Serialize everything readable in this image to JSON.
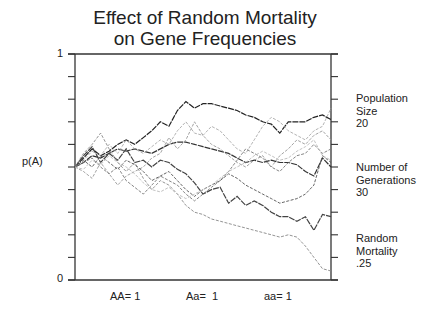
{
  "chart_data": {
    "type": "line",
    "title": "Effect of Random Mortality on Gene Frequencies",
    "title_lines": [
      "Effect of Random Mortality",
      "on Gene Frequencies"
    ],
    "xlabel": "",
    "ylabel": "p(A)",
    "ylim": [
      0,
      1
    ],
    "xlim": [
      0,
      30
    ],
    "y_tick_labels": [
      "0",
      "1"
    ],
    "y_ticks": [
      0,
      0.1,
      0.2,
      0.3,
      0.4,
      0.5,
      0.6,
      0.7,
      0.8,
      0.9,
      1.0
    ],
    "grid": false,
    "legend": "none",
    "parameters": {
      "population_size": 20,
      "number_of_generations": 30,
      "random_mortality": 0.25,
      "fitness": {
        "AA": 1,
        "Aa": 1,
        "aa": 1
      }
    },
    "x": [
      0,
      1,
      2,
      3,
      4,
      5,
      6,
      7,
      8,
      9,
      10,
      11,
      12,
      13,
      14,
      15,
      16,
      17,
      18,
      19,
      20,
      21,
      22,
      23,
      24,
      25,
      26,
      27,
      28,
      29,
      30
    ],
    "series": [
      {
        "name": "run 1",
        "shade": "#222222",
        "values": [
          0.5,
          0.54,
          0.58,
          0.55,
          0.57,
          0.6,
          0.62,
          0.6,
          0.63,
          0.66,
          0.7,
          0.68,
          0.75,
          0.79,
          0.76,
          0.78,
          0.78,
          0.77,
          0.76,
          0.75,
          0.73,
          0.72,
          0.7,
          0.69,
          0.65,
          0.7,
          0.7,
          0.7,
          0.72,
          0.73,
          0.71
        ]
      },
      {
        "name": "run 2",
        "shade": "#333333",
        "values": [
          0.5,
          0.52,
          0.55,
          0.54,
          0.56,
          0.58,
          0.57,
          0.58,
          0.57,
          0.56,
          0.58,
          0.6,
          0.61,
          0.61,
          0.6,
          0.59,
          0.58,
          0.57,
          0.56,
          0.54,
          0.52,
          0.53,
          0.52,
          0.53,
          0.52,
          0.52,
          0.51,
          0.48,
          0.46,
          0.54,
          0.5
        ]
      },
      {
        "name": "run 3",
        "shade": "#444444",
        "values": [
          0.5,
          0.55,
          0.59,
          0.52,
          0.56,
          0.53,
          0.58,
          0.52,
          0.53,
          0.5,
          0.53,
          0.52,
          0.49,
          0.47,
          0.43,
          0.38,
          0.4,
          0.41,
          0.34,
          0.37,
          0.33,
          0.35,
          0.33,
          0.3,
          0.28,
          0.28,
          0.26,
          0.28,
          0.22,
          0.29,
          0.28
        ]
      },
      {
        "name": "run 4",
        "shade": "#888888",
        "values": [
          0.5,
          0.56,
          0.6,
          0.65,
          0.58,
          0.52,
          0.48,
          0.52,
          0.45,
          0.4,
          0.44,
          0.42,
          0.38,
          0.33,
          0.3,
          0.29,
          0.27,
          0.26,
          0.25,
          0.24,
          0.23,
          0.22,
          0.21,
          0.2,
          0.19,
          0.2,
          0.19,
          0.15,
          0.1,
          0.05,
          0.04
        ]
      },
      {
        "name": "run 5",
        "shade": "#999999",
        "values": [
          0.5,
          0.48,
          0.45,
          0.52,
          0.47,
          0.42,
          0.46,
          0.48,
          0.5,
          0.54,
          0.56,
          0.63,
          0.58,
          0.62,
          0.7,
          0.64,
          0.6,
          0.58,
          0.55,
          0.52,
          0.5,
          0.53,
          0.55,
          0.5,
          0.55,
          0.58,
          0.62,
          0.6,
          0.64,
          0.66,
          0.62
        ]
      },
      {
        "name": "run 6",
        "shade": "#aaaaaa",
        "values": [
          0.5,
          0.53,
          0.57,
          0.55,
          0.6,
          0.56,
          0.62,
          0.58,
          0.56,
          0.59,
          0.62,
          0.6,
          0.66,
          0.7,
          0.65,
          0.64,
          0.68,
          0.66,
          0.62,
          0.58,
          0.56,
          0.62,
          0.68,
          0.72,
          0.7,
          0.66,
          0.64,
          0.62,
          0.66,
          0.68,
          0.76
        ]
      },
      {
        "name": "run 7",
        "shade": "#555555",
        "values": [
          0.5,
          0.53,
          0.5,
          0.55,
          0.52,
          0.49,
          0.53,
          0.51,
          0.48,
          0.44,
          0.46,
          0.48,
          0.44,
          0.4,
          0.37,
          0.4,
          0.42,
          0.44,
          0.47,
          0.45,
          0.42,
          0.4,
          0.38,
          0.36,
          0.34,
          0.35,
          0.36,
          0.38,
          0.42,
          0.55,
          0.52
        ]
      },
      {
        "name": "run 8",
        "shade": "#777777",
        "values": [
          0.5,
          0.52,
          0.54,
          0.5,
          0.47,
          0.5,
          0.44,
          0.41,
          0.38,
          0.42,
          0.46,
          0.44,
          0.42,
          0.38,
          0.35,
          0.38,
          0.41,
          0.44,
          0.48,
          0.53,
          0.58,
          0.56,
          0.54,
          0.5,
          0.48,
          0.52,
          0.55,
          0.56,
          0.6,
          0.56,
          0.58
        ]
      },
      {
        "name": "run 9",
        "shade": "#bbbbbb",
        "values": [
          0.5,
          0.49,
          0.53,
          0.51,
          0.55,
          0.52,
          0.5,
          0.47,
          0.43,
          0.4,
          0.39,
          0.41,
          0.38,
          0.36,
          0.38,
          0.4,
          0.42,
          0.45,
          0.48,
          0.5,
          0.52,
          0.55,
          0.57,
          0.55,
          0.53,
          0.54,
          0.57,
          0.59,
          0.62,
          0.55,
          0.53
        ]
      }
    ]
  },
  "side_labels": [
    {
      "lines": [
        "Population",
        "Size",
        "20"
      ]
    },
    {
      "lines": [
        "Number of",
        "Generations",
        "30"
      ]
    },
    {
      "lines": [
        "Random",
        "Mortality",
        ".25"
      ]
    }
  ],
  "fitness_labels": [
    "AA= 1",
    "Aa=  1",
    "aa= 1"
  ],
  "colors": {
    "axis": "#333333",
    "background": "#ffffff",
    "text": "#222222"
  }
}
